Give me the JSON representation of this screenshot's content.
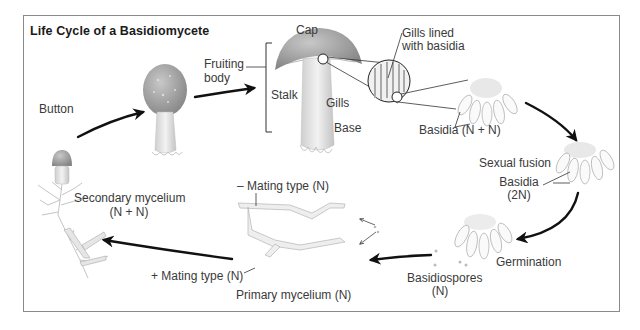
{
  "diagram": {
    "title": "Life Cycle of a Basidiomycete",
    "stages": [
      {
        "id": "button",
        "label": "Button"
      },
      {
        "id": "fruiting-body",
        "label": "Fruiting body"
      },
      {
        "id": "mature-mushroom",
        "parts": [
          "Cap",
          "Gills",
          "Stalk",
          "Base"
        ]
      },
      {
        "id": "gill-detail",
        "label": "Gills lined with basidia"
      },
      {
        "id": "basidia-nn",
        "label": "Basidia (N + N)"
      },
      {
        "id": "sexual-fusion",
        "label": "Sexual fusion"
      },
      {
        "id": "basidia-2n",
        "label": "Basidia (2N)"
      },
      {
        "id": "germination",
        "label": "Germination"
      },
      {
        "id": "basidiospores",
        "label": "Basidiospores (N)"
      },
      {
        "id": "primary-mycelium",
        "label": "Primary mycelium (N)"
      },
      {
        "id": "secondary-mycelium",
        "label": "Secondary mycelium (N + N)"
      }
    ],
    "labels": {
      "button": "Button",
      "fruiting_line1": "Fruiting",
      "fruiting_line2": "body",
      "cap": "Cap",
      "stalk": "Stalk",
      "gills": "Gills",
      "base": "Base",
      "gills_lined_line1": "Gills lined",
      "gills_lined_line2": "with basidia",
      "basidia_nn": "Basidia (N + N)",
      "sexual_fusion": "Sexual fusion",
      "basidia_2n_line1": "Basidia",
      "basidia_2n_line2": "(2N)",
      "germination": "Germination",
      "basidiospores_line1": "Basidiospores",
      "basidiospores_line2": "(N)",
      "minus_mating": "– Mating type (N)",
      "plus_mating": "+ Mating type (N)",
      "primary_mycelium": "Primary mycelium (N)",
      "secondary_line1": "Secondary mycelium",
      "secondary_line2": "(N + N)"
    },
    "colors": {
      "frame": "#8a8a8a",
      "arrow": "#111111",
      "cap_fill": "#9a9a9a",
      "stalk_fill": "#e2e2e2",
      "label_text": "#3a3a3a"
    }
  }
}
